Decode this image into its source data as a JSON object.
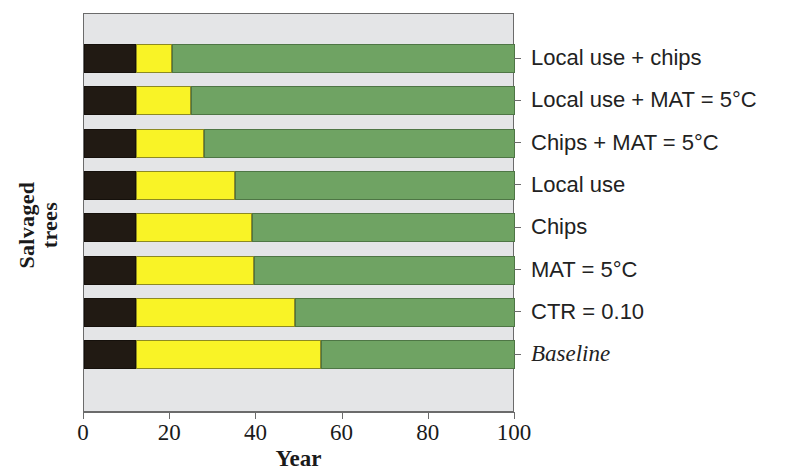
{
  "chart_data": {
    "type": "bar",
    "orientation": "horizontal",
    "stacked": true,
    "title": "",
    "xlabel": "Year",
    "ylabel": "Salvaged\ntrees",
    "xlim": [
      0,
      100
    ],
    "xticks": [
      0,
      20,
      40,
      60,
      80,
      100
    ],
    "xtick_labels": [
      "0",
      "20",
      "40",
      "60",
      "80",
      "100"
    ],
    "grid": false,
    "legend": "none",
    "plot_background": "#e4e5e7",
    "categories": [
      "Local use + chips",
      "Local use + MAT = 5°C",
      "Chips + MAT = 5°C",
      "Local use",
      "Chips",
      "MAT = 5°C",
      "CTR = 0.10",
      "Baseline"
    ],
    "category_styles": [
      "normal",
      "normal",
      "normal",
      "normal",
      "normal",
      "normal",
      "normal",
      "italic"
    ],
    "series": [
      {
        "name": "black-segment",
        "color": "#211a13",
        "values": [
          12,
          12,
          12,
          12,
          12,
          12,
          12,
          12
        ]
      },
      {
        "name": "yellow-segment",
        "color": "#f9f326",
        "values": [
          8.5,
          12.8,
          15.8,
          23,
          27,
          27.5,
          37,
          43
        ]
      },
      {
        "name": "green-segment",
        "color": "#6fa363",
        "values": [
          79.5,
          75.2,
          72.2,
          65,
          61,
          60.5,
          51,
          45
        ]
      }
    ],
    "cumulative_boundaries": [
      [
        12,
        20.5,
        100
      ],
      [
        12,
        24.8,
        100
      ],
      [
        12,
        27.8,
        100
      ],
      [
        12,
        35,
        100
      ],
      [
        12,
        39,
        100
      ],
      [
        12,
        39.5,
        100
      ],
      [
        12,
        49,
        100
      ],
      [
        12,
        55,
        100
      ]
    ]
  }
}
